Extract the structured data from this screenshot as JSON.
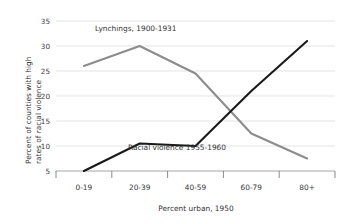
{
  "chart_data": {
    "type": "line",
    "title": "",
    "xlabel": "Percent urban, 1950",
    "ylabel": "Percent of counties with high rates of racial violence",
    "ylabel_line1": "Percent of counties with high",
    "ylabel_line2": "rates of racial violence",
    "categories": [
      "0-19",
      "20-39",
      "40-59",
      "60-79",
      "80+"
    ],
    "ylim": [
      5,
      35
    ],
    "yticks": [
      5,
      10,
      15,
      20,
      25,
      30,
      35
    ],
    "ytick_labels": [
      "5",
      "10",
      "15",
      "20",
      "25",
      "30",
      "35"
    ],
    "grid": true,
    "legend_position": "inline-annotations",
    "series": [
      {
        "name": "Lynchings, 1900-1931",
        "color": "#8c8c8c",
        "values": [
          26,
          30,
          24.5,
          12.5,
          7.5
        ]
      },
      {
        "name": "Racial violence 1955-1960",
        "color": "#1a1a1a",
        "values": [
          5,
          10.5,
          10,
          21,
          31
        ]
      }
    ],
    "annotations": [
      {
        "text": "Lynchings, 1900-1931",
        "x": 95,
        "y": 31
      },
      {
        "text": "Racial violence 1955-1960",
        "x": 128,
        "y": 150
      }
    ],
    "colors": {
      "background": "#ffffff",
      "gridline": "#d9d9d9",
      "axis": "#9a9a9a",
      "text": "#333333",
      "series_lynchings": "#8c8c8c",
      "series_racial_violence": "#1a1a1a"
    }
  }
}
